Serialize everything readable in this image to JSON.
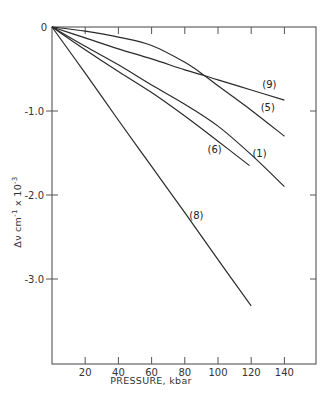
{
  "chart_data": {
    "type": "line",
    "title": "",
    "xlabel": "PRESSURE, kbar",
    "ylabel": "Δν cm⁻¹ x 10⁻³",
    "xlim": [
      0,
      158
    ],
    "ylim": [
      -3.99,
      0
    ],
    "x_ticks": [
      20,
      40,
      60,
      80,
      100,
      120,
      140
    ],
    "x_tick_labels": [
      "20",
      "40",
      "60",
      "80",
      "100",
      "120",
      "140"
    ],
    "y_ticks": [
      0,
      -1.0,
      -2.0,
      -3.0
    ],
    "y_tick_labels": [
      "0",
      "-1.0",
      "-2.0",
      "-3.0"
    ],
    "grid": false,
    "legend": "inline curve labels",
    "series": [
      {
        "name": "(9)",
        "x": [
          0,
          20,
          40,
          60,
          80,
          92,
          100,
          120,
          140
        ],
        "values": [
          0,
          -0.13,
          -0.26,
          -0.38,
          -0.51,
          -0.58,
          -0.63,
          -0.75,
          -0.87
        ],
        "label_pos": [
          131,
          -0.73
        ]
      },
      {
        "name": "(5)",
        "x": [
          0,
          20,
          40,
          60,
          80,
          92,
          100,
          120,
          140
        ],
        "values": [
          0,
          -0.05,
          -0.12,
          -0.22,
          -0.42,
          -0.58,
          -0.7,
          -0.99,
          -1.3
        ],
        "label_pos": [
          130,
          -1.0
        ]
      },
      {
        "name": "(1)",
        "x": [
          0,
          20,
          40,
          60,
          80,
          100,
          120,
          140
        ],
        "values": [
          0,
          -0.23,
          -0.45,
          -0.69,
          -0.92,
          -1.18,
          -1.52,
          -1.9
        ],
        "label_pos": [
          125,
          -1.55
        ]
      },
      {
        "name": "(6)",
        "x": [
          0,
          20,
          40,
          60,
          80,
          100,
          119
        ],
        "values": [
          0,
          -0.27,
          -0.53,
          -0.78,
          -1.06,
          -1.36,
          -1.65
        ],
        "label_pos": [
          98,
          -1.5
        ]
      },
      {
        "name": "(8)",
        "x": [
          0,
          20,
          40,
          60,
          80,
          100,
          120
        ],
        "values": [
          0,
          -0.55,
          -1.11,
          -1.66,
          -2.21,
          -2.77,
          -3.32
        ],
        "label_pos": [
          87,
          -2.28
        ]
      }
    ]
  },
  "labels": {
    "y_axis_title_main": "Δν  cm",
    "y_axis_title_sup1": "-1",
    "y_axis_title_mid": " x 10",
    "y_axis_title_sup2": "-3",
    "x_axis_title": "PRESSURE,  kbar"
  }
}
